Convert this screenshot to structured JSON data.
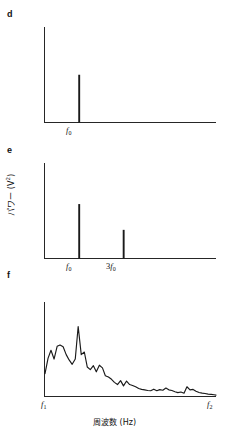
{
  "figure": {
    "axis_color": "#262626",
    "curve_color": "#1a1a1a",
    "background": "#ffffff",
    "y_axis_label_text": "パワー (V",
    "y_axis_label_exponent": "2",
    "y_axis_label_tail": ")",
    "x_axis_label": "周波数 (Hz)"
  },
  "panels": [
    {
      "id": "d",
      "label": "d",
      "type": "line-spectrum",
      "x_ticks": [
        {
          "label_main": "f",
          "label_sub": "0",
          "prefix": ""
        }
      ]
    },
    {
      "id": "e",
      "label": "e",
      "type": "line-spectrum",
      "x_ticks": [
        {
          "label_main": "f",
          "label_sub": "0",
          "prefix": ""
        },
        {
          "label_main": "f",
          "label_sub": "0",
          "prefix": "3"
        }
      ]
    },
    {
      "id": "f",
      "label": "f",
      "type": "continuous-spectrum",
      "x_ticks": [
        {
          "label_main": "f",
          "label_sub": "1",
          "prefix": ""
        },
        {
          "label_main": "f",
          "label_sub": "2",
          "prefix": ""
        }
      ]
    }
  ],
  "chart_data": [
    {
      "type": "bar",
      "panel": "d",
      "title": "",
      "xlabel": "周波数 (Hz)",
      "ylabel": "パワー (V2)",
      "categories": [
        "f0"
      ],
      "values": [
        0.5
      ],
      "ylim": [
        0,
        1
      ],
      "xlim": [
        0,
        1
      ],
      "x_positions": [
        0.2
      ],
      "grid": false,
      "legend": "none",
      "notes": "Single spectral line at the fundamental frequency f0, reaching about half of the y-axis height."
    },
    {
      "type": "bar",
      "panel": "e",
      "title": "",
      "xlabel": "周波数 (Hz)",
      "ylabel": "パワー (V2)",
      "categories": [
        "f0",
        "3f0"
      ],
      "values": [
        0.57,
        0.3
      ],
      "ylim": [
        0,
        1
      ],
      "xlim": [
        0,
        1
      ],
      "x_positions": [
        0.2,
        0.46
      ],
      "grid": false,
      "legend": "none",
      "notes": "Two spectral lines: fundamental f0 taller, third harmonic 3f0 about half as tall."
    },
    {
      "type": "line",
      "panel": "f",
      "title": "",
      "xlabel": "周波数 (Hz)",
      "ylabel": "パワー (V2)",
      "xlim": [
        0,
        1
      ],
      "ylim": [
        0,
        1
      ],
      "x_tick_labels": [
        "f1",
        "f2"
      ],
      "x_tick_positions": [
        0.0,
        1.0
      ],
      "grid": false,
      "legend": "none",
      "series": [
        {
          "name": "broadband spectrum",
          "x": [
            0.0,
            0.018,
            0.035,
            0.053,
            0.071,
            0.088,
            0.106,
            0.124,
            0.141,
            0.159,
            0.177,
            0.194,
            0.212,
            0.23,
            0.247,
            0.265,
            0.283,
            0.3,
            0.318,
            0.336,
            0.353,
            0.371,
            0.389,
            0.406,
            0.424,
            0.442,
            0.459,
            0.477,
            0.495,
            0.512,
            0.53,
            0.548,
            0.565,
            0.583,
            0.601,
            0.618,
            0.636,
            0.654,
            0.671,
            0.689,
            0.707,
            0.724,
            0.742,
            0.76,
            0.777,
            0.795,
            0.813,
            0.83,
            0.848,
            0.866,
            0.883,
            0.901,
            0.919,
            0.936,
            0.954,
            0.972,
            0.989,
            1.0
          ],
          "y": [
            0.255,
            0.43,
            0.52,
            0.42,
            0.565,
            0.58,
            0.56,
            0.47,
            0.41,
            0.36,
            0.42,
            0.79,
            0.47,
            0.5,
            0.33,
            0.3,
            0.345,
            0.275,
            0.35,
            0.32,
            0.23,
            0.215,
            0.19,
            0.155,
            0.13,
            0.175,
            0.115,
            0.17,
            0.13,
            0.12,
            0.105,
            0.085,
            0.075,
            0.07,
            0.062,
            0.06,
            0.078,
            0.06,
            0.072,
            0.065,
            0.09,
            0.07,
            0.062,
            0.048,
            0.038,
            0.045,
            0.032,
            0.105,
            0.07,
            0.075,
            0.055,
            0.04,
            0.032,
            0.028,
            0.022,
            0.018,
            0.014,
            0.01
          ]
        }
      ],
      "notes": "Broadband noise-like power spectrum, high at low frequency near f1 with a dominant peak around 20% of the span, decaying toward f2."
    }
  ]
}
